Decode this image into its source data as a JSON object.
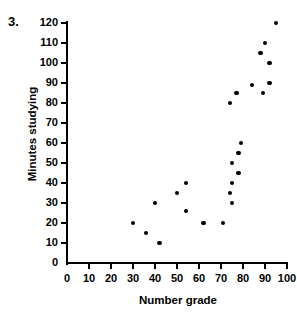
{
  "figure": {
    "problem_number": "3.",
    "background_color": "#ffffff",
    "marker_color": "#000000",
    "axis_color": "#000000"
  },
  "chart_data": {
    "type": "scatter",
    "title": "",
    "subtitle": "",
    "xlabel": "Number grade",
    "ylabel": "Minutes studying",
    "xlim": [
      0,
      100
    ],
    "ylim": [
      0,
      120
    ],
    "xticks": [
      0,
      10,
      20,
      30,
      40,
      50,
      60,
      70,
      80,
      90,
      100
    ],
    "yticks": [
      0,
      10,
      20,
      30,
      40,
      50,
      60,
      70,
      80,
      90,
      100,
      110,
      120
    ],
    "xtick_labels": [
      "0",
      "10",
      "20",
      "30",
      "40",
      "50",
      "60",
      "70",
      "80",
      "90",
      "100"
    ],
    "ytick_labels": [
      "0",
      "10",
      "20",
      "30",
      "40",
      "50",
      "60",
      "70",
      "80",
      "90",
      "100",
      "110",
      "120"
    ],
    "grid": false,
    "legend": null,
    "legend_position": "none",
    "series": [
      {
        "name": "Study time vs grade",
        "marker": "circle",
        "color": "#000000",
        "points": [
          {
            "x": 30,
            "y": 20
          },
          {
            "x": 36,
            "y": 15
          },
          {
            "x": 42,
            "y": 10
          },
          {
            "x": 40,
            "y": 30
          },
          {
            "x": 50,
            "y": 35
          },
          {
            "x": 54,
            "y": 40
          },
          {
            "x": 54,
            "y": 26
          },
          {
            "x": 62,
            "y": 20
          },
          {
            "x": 71,
            "y": 20
          },
          {
            "x": 75,
            "y": 30
          },
          {
            "x": 74,
            "y": 35
          },
          {
            "x": 75,
            "y": 40
          },
          {
            "x": 75,
            "y": 50
          },
          {
            "x": 78,
            "y": 45
          },
          {
            "x": 78,
            "y": 55
          },
          {
            "x": 79,
            "y": 60
          },
          {
            "x": 74,
            "y": 80
          },
          {
            "x": 77,
            "y": 85
          },
          {
            "x": 84,
            "y": 89
          },
          {
            "x": 88,
            "y": 105
          },
          {
            "x": 90,
            "y": 110
          },
          {
            "x": 89,
            "y": 85
          },
          {
            "x": 92,
            "y": 100
          },
          {
            "x": 92,
            "y": 90
          },
          {
            "x": 95,
            "y": 120
          }
        ]
      }
    ]
  }
}
